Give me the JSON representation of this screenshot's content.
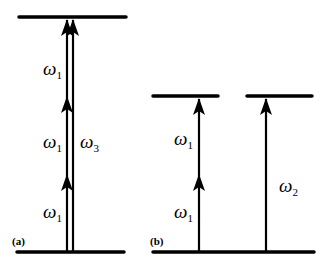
{
  "diagram": {
    "type": "energy-level-transition-diagram",
    "panels": [
      {
        "id": "a",
        "label": "(a)",
        "levels": [
          "ground",
          "excited"
        ],
        "transitions": [
          {
            "name": "three-photon path",
            "photons": [
              "ω1",
              "ω1",
              "ω1"
            ]
          },
          {
            "name": "single-photon path",
            "photons": [
              "ω3"
            ]
          }
        ]
      },
      {
        "id": "b",
        "label": "(b)",
        "levels": [
          "ground",
          "excited-left",
          "excited-right"
        ],
        "transitions": [
          {
            "name": "two-photon path",
            "photons": [
              "ω1",
              "ω1"
            ]
          },
          {
            "name": "single-photon path",
            "photons": [
              "ω2"
            ]
          }
        ]
      }
    ],
    "labels": {
      "a_w1_top": {
        "symbol": "ω",
        "sub": "1"
      },
      "a_w1_mid": {
        "symbol": "ω",
        "sub": "1"
      },
      "a_w1_bot": {
        "symbol": "ω",
        "sub": "1"
      },
      "a_w3": {
        "symbol": "ω",
        "sub": "3"
      },
      "b_w1_top": {
        "symbol": "ω",
        "sub": "1"
      },
      "b_w1_bot": {
        "symbol": "ω",
        "sub": "1"
      },
      "b_w2": {
        "symbol": "ω",
        "sub": "2"
      }
    },
    "panel_labels": {
      "a": "(a)",
      "b": "(b)"
    }
  }
}
